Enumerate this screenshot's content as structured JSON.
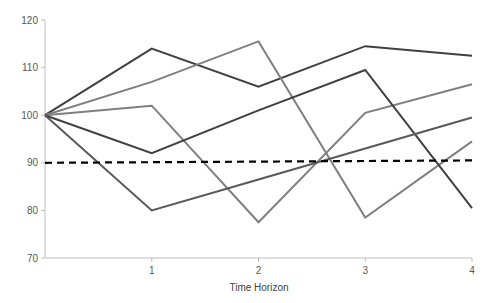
{
  "chart_data": {
    "type": "line",
    "title": "",
    "xlabel": "Time Horizon",
    "ylabel": "",
    "x": [
      0,
      1,
      2,
      3,
      4
    ],
    "x_tick_labels": [
      "1",
      "2",
      "3",
      "4"
    ],
    "y_tick_labels": [
      "70",
      "80",
      "90",
      "100",
      "110",
      "120"
    ],
    "ylim": [
      70,
      120
    ],
    "xlim": [
      0,
      4
    ],
    "grid": false,
    "legend": null,
    "series": [
      {
        "name": "Path 1",
        "color": "#404040",
        "values": [
          100,
          114,
          106,
          114.5,
          112.5
        ]
      },
      {
        "name": "Path 2",
        "color": "#7f7f7f",
        "values": [
          100,
          107,
          115.5,
          78.5,
          94.5
        ]
      },
      {
        "name": "Path 3",
        "color": "#7f7f7f",
        "values": [
          100,
          102,
          77.5,
          100.5,
          106.5
        ]
      },
      {
        "name": "Path 4",
        "color": "#404040",
        "values": [
          100,
          92,
          101,
          109.5,
          80.5
        ]
      },
      {
        "name": "Path 5",
        "color": "#595959",
        "values": [
          100,
          80,
          86.5,
          93,
          99.5
        ]
      }
    ],
    "reference_line": {
      "name": "Threshold",
      "style": "dashed",
      "color": "#000000",
      "values": [
        90,
        90.5
      ]
    }
  }
}
